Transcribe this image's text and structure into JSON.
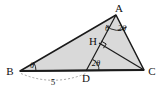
{
  "figure": {
    "type": "geometry-diagram",
    "background_color": "#ffffff",
    "fill_color": "#d9d9d9",
    "stroke_color": "#1a1a1a",
    "dash_color": "#8a8a8a"
  },
  "points": {
    "A": {
      "label": "A",
      "x": 116,
      "y": 15
    },
    "B": {
      "label": "B",
      "x": 20,
      "y": 71
    },
    "C": {
      "label": "C",
      "x": 144,
      "y": 70
    },
    "D": {
      "label": "D",
      "x": 86,
      "y": 71
    },
    "H": {
      "label": "H",
      "x": 100,
      "y": 44
    }
  },
  "labels": {
    "A": "A",
    "B": "B",
    "C": "C",
    "D": "D",
    "H": "H"
  },
  "angles": {
    "at_B": "θ",
    "at_D": "2θ",
    "at_A_left": "θ",
    "at_A_right": "2θ",
    "at_H": "right angle"
  },
  "measures": {
    "BD": "5"
  },
  "segments": [
    {
      "name": "AB",
      "from": "A",
      "to": "B"
    },
    {
      "name": "BC",
      "from": "B",
      "to": "C"
    },
    {
      "name": "AC",
      "from": "A",
      "to": "C"
    },
    {
      "name": "AD",
      "from": "A",
      "to": "D"
    },
    {
      "name": "CH",
      "from": "C",
      "to": "H"
    }
  ]
}
